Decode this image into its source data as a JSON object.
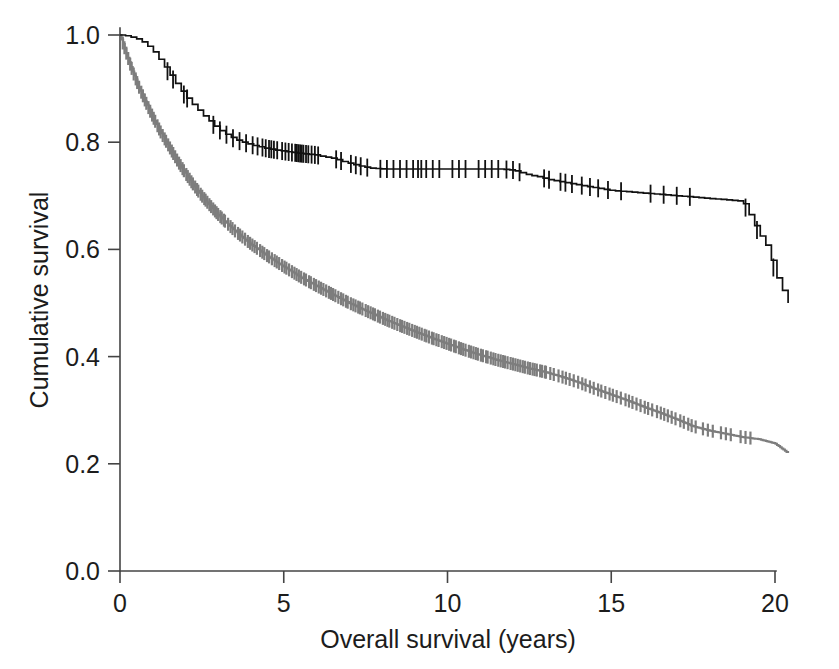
{
  "chart_data": {
    "type": "line",
    "title": "",
    "subtitle": "",
    "xlabel": "Overall survival (years)",
    "ylabel": "Cumulative survival",
    "xlim": [
      0,
      20.8
    ],
    "ylim": [
      0,
      1.0
    ],
    "xticks": [
      0,
      5,
      10,
      15,
      20
    ],
    "xtick_labels": [
      "0",
      "5",
      "10",
      "15",
      "20"
    ],
    "yticks": [
      0.0,
      0.2,
      0.4,
      0.6,
      0.8,
      1.0
    ],
    "ytick_labels": [
      "0.0",
      "0.2",
      "0.4",
      "0.6",
      "0.8",
      "1.0"
    ],
    "grid": false,
    "legend_position": "none",
    "plot_style": "kaplan-meier-step-with-censoring-ticks",
    "series": [
      {
        "name": "upper-curve",
        "color": "#111111",
        "censor_marks": true,
        "description": "Upper Kaplan-Meier curve: gradual decline from 1.00 to a long plateau near 0.75, stepping down to 0.60 by year 13 and ending at 0.50 at year 20",
        "x": [
          0,
          0.25,
          0.5,
          0.75,
          1.0,
          1.25,
          1.5,
          1.75,
          2.0,
          2.25,
          2.5,
          2.75,
          3.0,
          3.3,
          3.6,
          4.0,
          4.5,
          5.0,
          5.5,
          6.0,
          6.2,
          6.5,
          6.9,
          7.2,
          7.6,
          8.0,
          8.4,
          8.8,
          9.1,
          9.4,
          9.7,
          10.0,
          10.4,
          10.8,
          11.2,
          11.6,
          12.0,
          12.4,
          12.8,
          13.1,
          14.0,
          15.0,
          16.0,
          17.0,
          18.0,
          19.0,
          19.25,
          19.5,
          19.8,
          20.0,
          20.4
        ],
        "y": [
          1.0,
          0.998,
          0.993,
          0.985,
          0.97,
          0.95,
          0.928,
          0.905,
          0.885,
          0.868,
          0.852,
          0.838,
          0.824,
          0.812,
          0.803,
          0.795,
          0.788,
          0.783,
          0.779,
          0.776,
          0.773,
          0.77,
          0.762,
          0.757,
          0.752,
          0.75,
          0.75,
          0.75,
          0.75,
          0.75,
          0.75,
          0.75,
          0.75,
          0.75,
          0.75,
          0.75,
          0.748,
          0.74,
          0.735,
          0.73,
          0.72,
          0.71,
          0.705,
          0.7,
          0.695,
          0.69,
          0.66,
          0.63,
          0.6,
          0.555,
          0.5
        ]
      },
      {
        "name": "lower-curve",
        "color": "#7d7d7d",
        "censor_marks": true,
        "description": "Lower Kaplan-Meier curve: steep early decline from 1.00 to about 0.60 by year 3, then steady decline reaching about 0.22 at year 20",
        "x": [
          0,
          0.2,
          0.4,
          0.6,
          0.8,
          1.0,
          1.25,
          1.5,
          1.75,
          2.0,
          2.25,
          2.5,
          2.75,
          3.0,
          3.5,
          4.0,
          4.5,
          5.0,
          5.5,
          6.0,
          6.5,
          7.0,
          7.5,
          8.0,
          8.5,
          9.0,
          9.5,
          10.0,
          10.5,
          11.0,
          11.5,
          12.0,
          12.5,
          13.0,
          13.5,
          14.0,
          14.5,
          15.0,
          15.5,
          16.0,
          16.5,
          17.0,
          17.5,
          18.0,
          18.5,
          19.0,
          19.5,
          20.0,
          20.4
        ],
        "y": [
          1.0,
          0.965,
          0.93,
          0.9,
          0.873,
          0.848,
          0.818,
          0.792,
          0.766,
          0.742,
          0.72,
          0.7,
          0.682,
          0.665,
          0.635,
          0.61,
          0.588,
          0.568,
          0.549,
          0.532,
          0.516,
          0.5,
          0.486,
          0.472,
          0.459,
          0.447,
          0.435,
          0.424,
          0.413,
          0.403,
          0.394,
          0.386,
          0.378,
          0.371,
          0.362,
          0.352,
          0.34,
          0.329,
          0.318,
          0.306,
          0.295,
          0.283,
          0.27,
          0.262,
          0.256,
          0.25,
          0.246,
          0.238,
          0.22
        ]
      }
    ],
    "annotations": []
  },
  "axes": {
    "x": {
      "label": "Overall survival (years)",
      "ticks": [
        "0",
        "5",
        "10",
        "15",
        "20"
      ]
    },
    "y": {
      "label": "Cumulative survival",
      "ticks": [
        "0.0",
        "0.2",
        "0.4",
        "0.6",
        "0.8",
        "1.0"
      ]
    }
  }
}
